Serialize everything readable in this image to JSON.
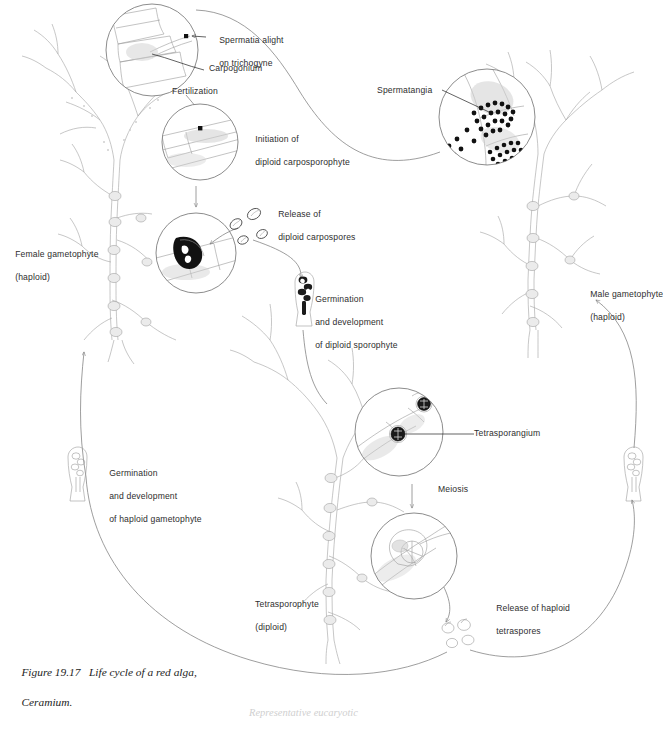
{
  "figure": {
    "caption_line1": "Figure 19.17   Life cycle of a red alga,",
    "caption_line2": "Ceramium.",
    "footer": "Representative eucaryotic"
  },
  "labels": {
    "spermatia_line1": "Spermatia alight",
    "spermatia_line2": "on trichogyne",
    "carpogonium": "Carpogonium",
    "fertilization": "Fertilization",
    "initiation_line1": "Initiation of",
    "initiation_line2": "diploid carposporophyte",
    "release_carpo_line1": "Release of",
    "release_carpo_line2": "diploid carpospores",
    "germ_diploid_line1": "Germination",
    "germ_diploid_line2": "and development",
    "germ_diploid_line3": "of diploid sporophyte",
    "spermatangia": "Spermatangia",
    "female_line1": "Female gametophyte",
    "female_line2": "(haploid)",
    "male_line1": "Male gametophyte",
    "male_line2": "(haploid)",
    "tetrasporangium": "Tetrasporangium",
    "meiosis": "Meiosis",
    "release_tetra_line1": "Release of haploid",
    "release_tetra_line2": "tetraspores",
    "tetrasporophyte_line1": "Tetrasporophyte",
    "tetrasporophyte_line2": "(diploid)",
    "germ_haploid_line1": "Germination",
    "germ_haploid_line2": "and development",
    "germ_haploid_line3": "of haploid gametophyte"
  },
  "icons": {
    "fertilization_circle": "fertilization-detail-circle",
    "carposporophyte_circle": "carposporophyte-detail-circle",
    "carpospore_release_circle": "carpospore-release-detail-circle",
    "spermatangia_circle": "spermatangia-detail-circle",
    "tetrasporangium_circle": "tetrasporangium-detail-circle",
    "tetraspore_release_circle": "tetraspore-release-detail-circle",
    "female_thallus": "female-gametophyte-thallus",
    "male_thallus": "male-gametophyte-thallus",
    "tetrasporophyte_thallus": "tetrasporophyte-thallus",
    "diploid_germling": "diploid-sporeling-icon",
    "haploid_germling_left": "haploid-sporeling-icon-left",
    "haploid_germling_right": "haploid-sporeling-icon-right"
  },
  "colors": {
    "ink": "#2b2b2b",
    "line": "#7d7d7d",
    "alga": "#a9a9a9",
    "dark_fill": "#111111",
    "footer": "#cfcfcf",
    "background": "#ffffff"
  }
}
